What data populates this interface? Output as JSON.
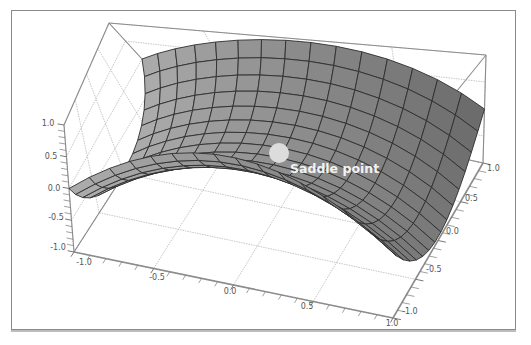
{
  "chart_data": {
    "type": "surface3d",
    "title": "",
    "function": "z = x^2 - y^2 (hyperbolic paraboloid / saddle)",
    "x_range": [
      -1.0,
      1.0
    ],
    "y_range": [
      -1.0,
      1.0
    ],
    "z_range": [
      -1.0,
      1.0
    ],
    "mesh_lines": 15,
    "x_ticks": [
      "-1.0",
      "-0.5",
      "0.0",
      "0.5",
      "1.0"
    ],
    "y_ticks": [
      "-1.0",
      "-0.5",
      "0.0",
      "0.5",
      "1.0"
    ],
    "z_ticks": [
      "-1.0",
      "-0.5",
      "0.0",
      "0.5",
      "1.0"
    ],
    "grid": true,
    "box": true,
    "annotations": [
      {
        "text": "Saddle point",
        "x": 0.0,
        "y": 0.0,
        "z": 0.0,
        "marker": "circle",
        "marker_color": "#dcdcdc"
      }
    ],
    "colors": {
      "surface_light": "#c4c4c4",
      "surface_dark": "#3a3a3a",
      "mesh": "#2e2e2e",
      "box_edge": "#8c8c8c",
      "grid": "#b8b8b8",
      "label_text": "#f2f2f2"
    }
  },
  "axes": {
    "front_x_labels": [
      "-1.0",
      "-0.5",
      "0.0",
      "0.5",
      "1.0"
    ],
    "right_y_labels": [
      "-1.0",
      "-0.5",
      "0.0",
      "0.5",
      "1.0"
    ],
    "left_z_labels": [
      "1.0",
      "0.5",
      "0.0",
      "-0.5",
      "-1.0"
    ]
  },
  "annotation": {
    "label": "Saddle point"
  }
}
